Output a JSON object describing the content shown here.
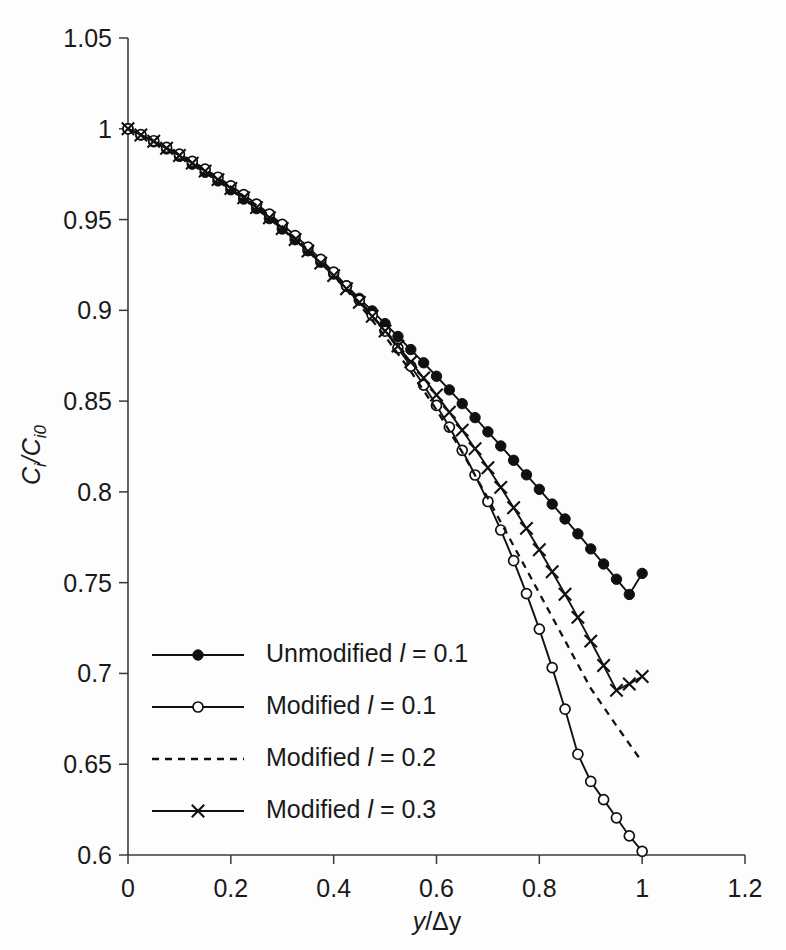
{
  "chart_data": {
    "type": "line",
    "title": "",
    "xlabel": "y/Δy",
    "ylabel": "Ci/Ci0",
    "xlim": [
      0,
      1.2
    ],
    "ylim": [
      0.6,
      1.05
    ],
    "xticks": [
      "0",
      "0.2",
      "0.4",
      "0.6",
      "0.8",
      "1",
      "1.2"
    ],
    "xtick_values": [
      0,
      0.2,
      0.4,
      0.6,
      0.8,
      1.0,
      1.2
    ],
    "yticks": [
      "0.6",
      "0.65",
      "0.7",
      "0.75",
      "0.8",
      "0.85",
      "0.9",
      "0.95",
      "1",
      "1.05"
    ],
    "ytick_values": [
      0.6,
      0.65,
      0.7,
      0.75,
      0.8,
      0.85,
      0.9,
      0.95,
      1.0,
      1.05
    ],
    "grid": false,
    "legend_position": "lower-left",
    "series": [
      {
        "name": "Unmodified l = 0.1",
        "marker": "filled-circle",
        "linestyle": "solid",
        "x": [
          0,
          0.025,
          0.05,
          0.075,
          0.1,
          0.125,
          0.15,
          0.175,
          0.2,
          0.225,
          0.25,
          0.275,
          0.3,
          0.325,
          0.35,
          0.375,
          0.4,
          0.425,
          0.45,
          0.475,
          0.5,
          0.525,
          0.55,
          0.575,
          0.6,
          0.625,
          0.65,
          0.675,
          0.7,
          0.725,
          0.75,
          0.775,
          0.8,
          0.825,
          0.85,
          0.875,
          0.9,
          0.925,
          0.95,
          0.975,
          1.0
        ],
        "values": [
          1.0,
          0.9965,
          0.9928,
          0.9889,
          0.9848,
          0.9805,
          0.976,
          0.9713,
          0.9664,
          0.9613,
          0.956,
          0.9505,
          0.9448,
          0.9389,
          0.9328,
          0.9265,
          0.92,
          0.9134,
          0.9066,
          0.8997,
          0.8927,
          0.8856,
          0.8784,
          0.8711,
          0.8637,
          0.8562,
          0.8486,
          0.8409,
          0.8331,
          0.8253,
          0.8174,
          0.8094,
          0.8014,
          0.7933,
          0.7851,
          0.7769,
          0.7686,
          0.7603,
          0.7519,
          0.7435,
          0.7551
        ]
      },
      {
        "name": "Modified l = 0.1",
        "marker": "open-circle",
        "linestyle": "solid",
        "x": [
          0,
          0.025,
          0.05,
          0.075,
          0.1,
          0.125,
          0.15,
          0.175,
          0.2,
          0.225,
          0.25,
          0.275,
          0.3,
          0.325,
          0.35,
          0.375,
          0.4,
          0.425,
          0.45,
          0.475,
          0.5,
          0.525,
          0.55,
          0.575,
          0.6,
          0.625,
          0.65,
          0.675,
          0.7,
          0.725,
          0.75,
          0.775,
          0.8,
          0.825,
          0.85,
          0.875,
          0.9,
          0.925,
          0.95,
          0.975,
          1.0
        ],
        "values": [
          1.0,
          0.9968,
          0.9934,
          0.9898,
          0.986,
          0.982,
          0.9778,
          0.9733,
          0.9686,
          0.9637,
          0.9585,
          0.953,
          0.9473,
          0.9412,
          0.9348,
          0.9281,
          0.921,
          0.9135,
          0.9056,
          0.8973,
          0.8885,
          0.8792,
          0.8693,
          0.8588,
          0.8476,
          0.8357,
          0.8229,
          0.8093,
          0.7947,
          0.779,
          0.7621,
          0.744,
          0.7244,
          0.7032,
          0.6803,
          0.6555,
          0.6405,
          0.6305,
          0.6205,
          0.6105,
          0.602
        ]
      },
      {
        "name": "Modified l = 0.2",
        "marker": "none",
        "linestyle": "dashed",
        "x": [
          0,
          0.05,
          0.1,
          0.15,
          0.2,
          0.25,
          0.3,
          0.35,
          0.4,
          0.45,
          0.5,
          0.55,
          0.6,
          0.65,
          0.7,
          0.75,
          0.8,
          0.85,
          0.9,
          0.95,
          1.0
        ],
        "values": [
          1.0,
          0.993,
          0.9855,
          0.9772,
          0.9681,
          0.9578,
          0.9463,
          0.9334,
          0.9191,
          0.9032,
          0.8857,
          0.8664,
          0.8452,
          0.8219,
          0.7964,
          0.7703,
          0.7442,
          0.718,
          0.6918,
          0.6712,
          0.6512
        ]
      },
      {
        "name": "Modified l = 0.3",
        "marker": "cross",
        "linestyle": "solid",
        "x": [
          0,
          0.025,
          0.05,
          0.075,
          0.1,
          0.125,
          0.15,
          0.175,
          0.2,
          0.225,
          0.25,
          0.275,
          0.3,
          0.325,
          0.35,
          0.375,
          0.4,
          0.425,
          0.45,
          0.475,
          0.5,
          0.525,
          0.55,
          0.575,
          0.6,
          0.625,
          0.65,
          0.675,
          0.7,
          0.725,
          0.75,
          0.775,
          0.8,
          0.825,
          0.85,
          0.875,
          0.9,
          0.925,
          0.95,
          0.975,
          1.0
        ],
        "values": [
          1.0,
          0.9966,
          0.9931,
          0.9893,
          0.9853,
          0.9811,
          0.9767,
          0.972,
          0.9671,
          0.962,
          0.9566,
          0.951,
          0.9451,
          0.939,
          0.9326,
          0.926,
          0.9191,
          0.9119,
          0.9044,
          0.8967,
          0.8886,
          0.8803,
          0.8716,
          0.8627,
          0.8534,
          0.8439,
          0.834,
          0.8238,
          0.8133,
          0.8025,
          0.7913,
          0.7799,
          0.7681,
          0.756,
          0.7436,
          0.7309,
          0.7178,
          0.7044,
          0.6907,
          0.6942,
          0.6983
        ]
      }
    ]
  },
  "legend": {
    "items": [
      {
        "label_plain": "Unmodified ",
        "symbol": "l",
        "label_tail": " = 0.1",
        "marker": "filled-circle",
        "linestyle": "solid"
      },
      {
        "label_plain": "Modified ",
        "symbol": "l",
        "label_tail": " = 0.1",
        "marker": "open-circle",
        "linestyle": "solid"
      },
      {
        "label_plain": "Modified ",
        "symbol": "l",
        "label_tail": " = 0.2",
        "marker": "none",
        "linestyle": "dashed"
      },
      {
        "label_plain": "Modified ",
        "symbol": "l",
        "label_tail": " = 0.3",
        "marker": "cross",
        "linestyle": "solid"
      }
    ]
  },
  "axes": {
    "y_label_main": "C",
    "y_label_sub1": "i",
    "y_label_mid": "/C",
    "y_label_sub2": "i0",
    "x_label_num": "y",
    "x_label_den": "/Δy"
  },
  "colors": {
    "ink": "#111111",
    "axis": "#3a3a3a",
    "background": "#fdfdfd"
  }
}
